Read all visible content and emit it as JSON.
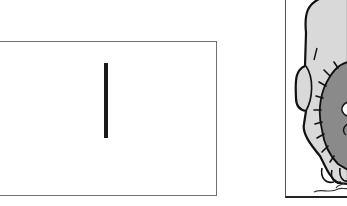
{
  "scene": {
    "description": "Comic strip fragment: an empty bordered panel with a single vertical bar, and a partially visible panel showing a cartoon lion",
    "left_panel": {
      "content": "vertical-bar",
      "bar_color": "#1a1a1a",
      "border_color": "#6f6f6f"
    },
    "right_panel": {
      "content": "cartoon-lion-partial",
      "body_fill": "#d9d9d9",
      "mane_fill": "#8a8a8a",
      "outline_color": "#111111",
      "border_color": "#555555"
    }
  }
}
